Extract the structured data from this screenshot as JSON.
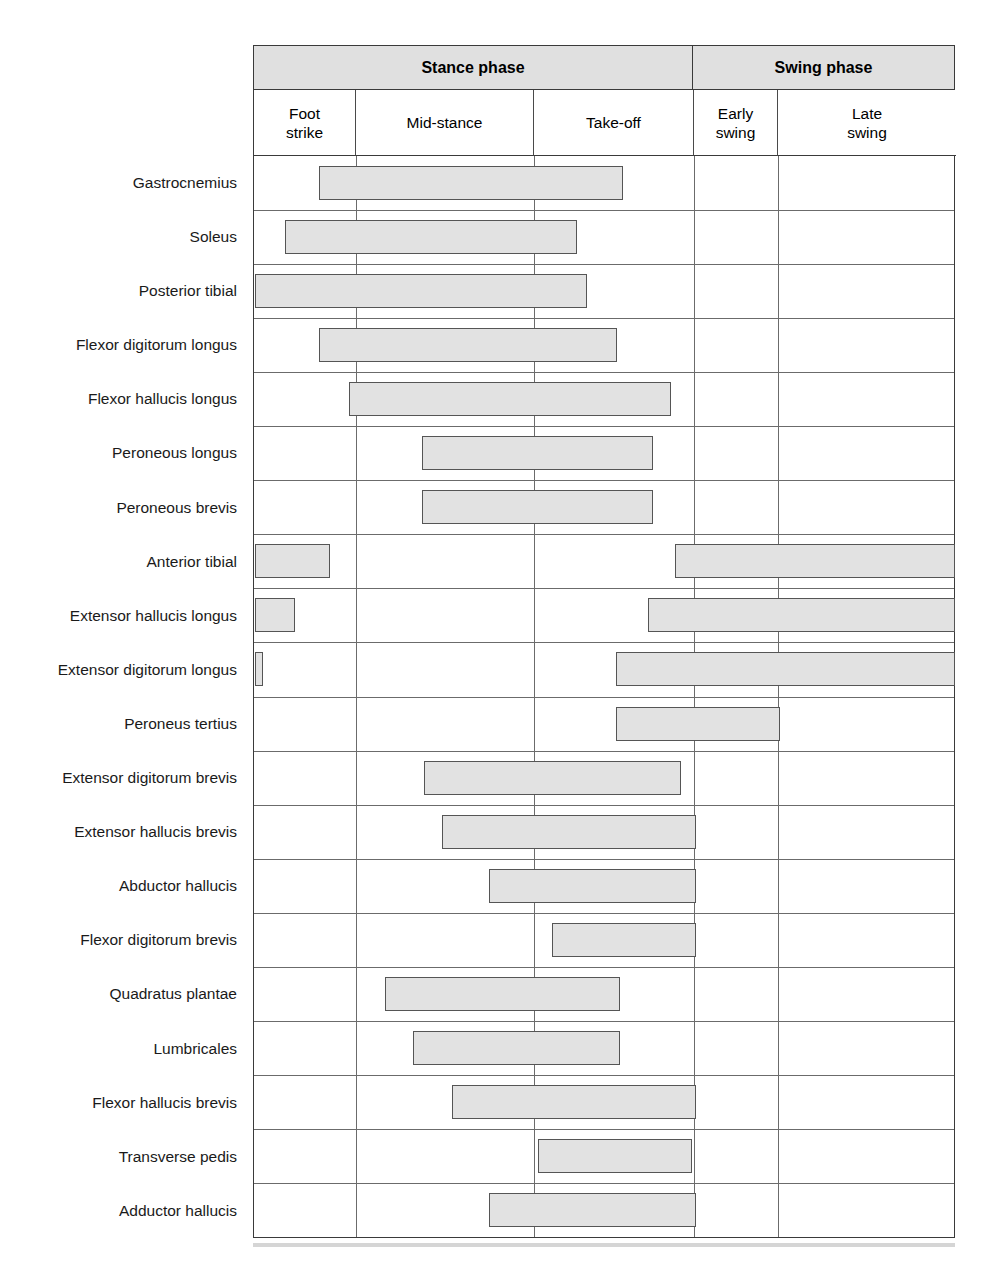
{
  "figure": {
    "accent_color": "#e0e0e0",
    "bar_fill": "#e2e2e2",
    "bar_border": "#555555",
    "grid_color": "#6b6b6b"
  },
  "header": {
    "phases": [
      {
        "label": "Stance phase",
        "start": 0,
        "end": 3
      },
      {
        "label": "Swing phase",
        "start": 3,
        "end": 5
      }
    ],
    "subphases": [
      {
        "label": "Foot\nstrike",
        "key": "foot_strike"
      },
      {
        "label": "Mid-stance",
        "key": "mid_stance"
      },
      {
        "label": "Take-off",
        "key": "take_off"
      },
      {
        "label": "Early\nswing",
        "key": "early_swing"
      },
      {
        "label": "Late\nswing",
        "key": "late_swing"
      }
    ]
  },
  "chart_data": {
    "type": "bar",
    "xlabel": "Gait cycle phase",
    "ylabel": "Muscle",
    "grid": true,
    "legend": "none",
    "x_axis": {
      "kind": "categorical-segments",
      "segments": [
        "Foot strike",
        "Mid-stance",
        "Take-off",
        "Early swing",
        "Late swing"
      ],
      "groups": [
        {
          "name": "Stance phase",
          "segments": [
            "Foot strike",
            "Mid-stance",
            "Take-off"
          ]
        },
        {
          "name": "Swing phase",
          "segments": [
            "Early swing",
            "Late swing"
          ]
        }
      ],
      "boundaries_px": [
        253,
        355,
        533,
        693,
        777,
        955
      ],
      "xlim_px": [
        253,
        955
      ]
    },
    "categories": [
      "Gastrocnemius",
      "Soleus",
      "Posterior tibial",
      "Flexor digitorum longus",
      "Flexor hallucis longus",
      "Peroneous longus",
      "Peroneous brevis",
      "Anterior tibial",
      "Extensor hallucis longus",
      "Extensor digitorum longus",
      "Peroneus tertius",
      "Extensor digitorum brevis",
      "Extensor hallucis brevis",
      "Abductor hallucis",
      "Flexor digitorum brevis",
      "Quadratus plantae",
      "Lumbricales",
      "Flexor hallucis brevis",
      "Transverse pedis",
      "Adductor hallucis"
    ],
    "rows": [
      {
        "muscle": "Gastrocnemius",
        "bars": [
          {
            "x0": 318,
            "x1": 622
          }
        ]
      },
      {
        "muscle": "Soleus",
        "bars": [
          {
            "x0": 284,
            "x1": 576
          }
        ]
      },
      {
        "muscle": "Posterior tibial",
        "bars": [
          {
            "x0": 254,
            "x1": 586
          }
        ]
      },
      {
        "muscle": "Flexor digitorum longus",
        "bars": [
          {
            "x0": 318,
            "x1": 616
          }
        ]
      },
      {
        "muscle": "Flexor hallucis longus",
        "bars": [
          {
            "x0": 348,
            "x1": 670
          }
        ]
      },
      {
        "muscle": "Peroneous longus",
        "bars": [
          {
            "x0": 421,
            "x1": 652
          }
        ]
      },
      {
        "muscle": "Peroneous brevis",
        "bars": [
          {
            "x0": 421,
            "x1": 652
          }
        ]
      },
      {
        "muscle": "Anterior tibial",
        "bars": [
          {
            "x0": 254,
            "x1": 329
          },
          {
            "x0": 674,
            "x1": 954
          }
        ]
      },
      {
        "muscle": "Extensor hallucis longus",
        "bars": [
          {
            "x0": 254,
            "x1": 294
          },
          {
            "x0": 647,
            "x1": 954
          }
        ]
      },
      {
        "muscle": "Extensor digitorum longus",
        "bars": [
          {
            "x0": 254,
            "x1": 262
          },
          {
            "x0": 615,
            "x1": 954
          }
        ]
      },
      {
        "muscle": "Peroneus tertius",
        "bars": [
          {
            "x0": 615,
            "x1": 779
          }
        ]
      },
      {
        "muscle": "Extensor digitorum brevis",
        "bars": [
          {
            "x0": 423,
            "x1": 680
          }
        ]
      },
      {
        "muscle": "Extensor hallucis brevis",
        "bars": [
          {
            "x0": 441,
            "x1": 695
          }
        ]
      },
      {
        "muscle": "Abductor hallucis",
        "bars": [
          {
            "x0": 488,
            "x1": 695
          }
        ]
      },
      {
        "muscle": "Flexor digitorum brevis",
        "bars": [
          {
            "x0": 551,
            "x1": 695
          }
        ]
      },
      {
        "muscle": "Quadratus plantae",
        "bars": [
          {
            "x0": 384,
            "x1": 619
          }
        ]
      },
      {
        "muscle": "Lumbricales",
        "bars": [
          {
            "x0": 412,
            "x1": 619
          }
        ]
      },
      {
        "muscle": "Flexor hallucis brevis",
        "bars": [
          {
            "x0": 451,
            "x1": 695
          }
        ]
      },
      {
        "muscle": "Transverse pedis",
        "bars": [
          {
            "x0": 537,
            "x1": 691
          }
        ]
      },
      {
        "muscle": "Adductor hallucis",
        "bars": [
          {
            "x0": 488,
            "x1": 695
          }
        ]
      }
    ]
  }
}
